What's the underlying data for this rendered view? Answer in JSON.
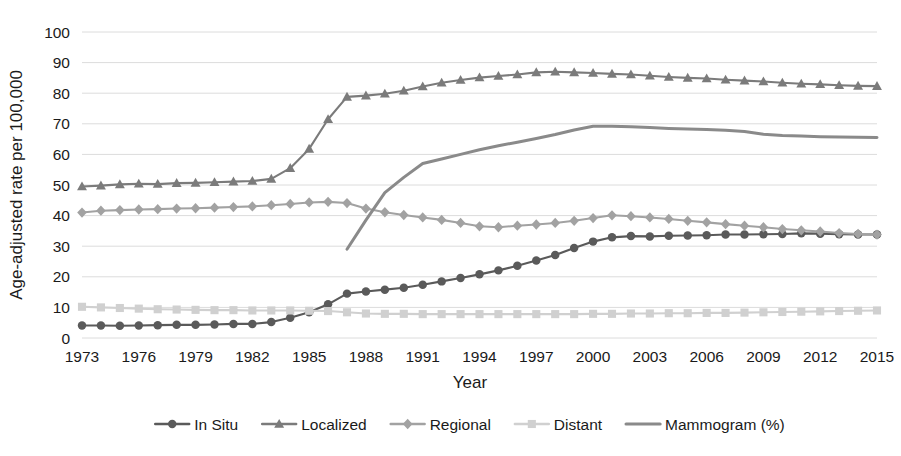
{
  "chart_data": {
    "type": "line",
    "title": "",
    "xlabel": "Year",
    "ylabel": "Age-adjusted rate per 100,000",
    "xlim": [
      1973,
      2015
    ],
    "ylim": [
      0,
      100
    ],
    "ytick_step": 10,
    "xtick_step": 3,
    "grid": true,
    "legend_position": "bottom",
    "yticks": [
      "0",
      "10",
      "20",
      "30",
      "40",
      "50",
      "60",
      "70",
      "80",
      "90",
      "100"
    ],
    "xticks": [
      "1973",
      "1976",
      "1979",
      "1982",
      "1985",
      "1988",
      "1991",
      "1994",
      "1997",
      "2000",
      "2003",
      "2006",
      "2009",
      "2012",
      "2015"
    ],
    "x": [
      1973,
      1974,
      1975,
      1976,
      1977,
      1978,
      1979,
      1980,
      1981,
      1982,
      1983,
      1984,
      1985,
      1986,
      1987,
      1988,
      1989,
      1990,
      1991,
      1992,
      1993,
      1994,
      1995,
      1996,
      1997,
      1998,
      1999,
      2000,
      2001,
      2002,
      2003,
      2004,
      2005,
      2006,
      2007,
      2008,
      2009,
      2010,
      2011,
      2012,
      2013,
      2014,
      2015
    ],
    "series": [
      {
        "name": "In Situ",
        "marker": "circle",
        "color": "#5a5a5a",
        "values": [
          4.1,
          4.1,
          4.0,
          4.1,
          4.2,
          4.3,
          4.3,
          4.4,
          4.6,
          4.6,
          5.2,
          6.6,
          8.4,
          11.0,
          14.5,
          15.2,
          15.8,
          16.4,
          17.4,
          18.5,
          19.6,
          20.8,
          22.1,
          23.6,
          25.3,
          27.1,
          29.4,
          31.5,
          32.9,
          33.3,
          33.2,
          33.4,
          33.5,
          33.6,
          33.8,
          33.8,
          33.9,
          34.0,
          34.2,
          34.1,
          33.9,
          33.8,
          33.8
        ]
      },
      {
        "name": "Localized",
        "marker": "triangle",
        "color": "#7b7b7b",
        "values": [
          49.5,
          49.8,
          50.2,
          50.4,
          50.3,
          50.6,
          50.7,
          50.9,
          51.1,
          51.3,
          52.0,
          55.5,
          61.8,
          71.5,
          78.8,
          79.2,
          79.8,
          80.8,
          82.2,
          83.4,
          84.3,
          85.1,
          85.6,
          86.1,
          86.8,
          87.0,
          86.8,
          86.6,
          86.3,
          86.1,
          85.7,
          85.3,
          85.0,
          84.8,
          84.4,
          84.1,
          83.8,
          83.4,
          83.1,
          82.9,
          82.6,
          82.4,
          82.3
        ]
      },
      {
        "name": "Regional",
        "marker": "diamond",
        "color": "#a2a2a2",
        "values": [
          41.0,
          41.6,
          41.8,
          42.0,
          42.1,
          42.3,
          42.4,
          42.6,
          42.8,
          43.0,
          43.4,
          43.8,
          44.3,
          44.5,
          44.1,
          42.3,
          41.1,
          40.2,
          39.4,
          38.6,
          37.6,
          36.5,
          36.2,
          36.7,
          37.1,
          37.6,
          38.3,
          39.2,
          40.1,
          39.8,
          39.4,
          38.9,
          38.3,
          37.8,
          37.2,
          36.7,
          36.2,
          35.6,
          35.2,
          34.8,
          34.3,
          34.0,
          33.8
        ]
      },
      {
        "name": "Distant",
        "marker": "square",
        "color": "#d0d0d0",
        "values": [
          10.2,
          10.0,
          9.8,
          9.6,
          9.4,
          9.3,
          9.2,
          9.1,
          9.1,
          9.0,
          9.0,
          9.0,
          8.9,
          8.8,
          8.4,
          8.0,
          7.9,
          7.9,
          7.8,
          7.8,
          7.8,
          7.8,
          7.8,
          7.8,
          7.8,
          7.8,
          7.8,
          7.9,
          7.9,
          8.0,
          8.0,
          8.1,
          8.1,
          8.2,
          8.2,
          8.3,
          8.4,
          8.5,
          8.6,
          8.7,
          8.8,
          8.9,
          9.0
        ]
      },
      {
        "name": "Mammogram (%)",
        "marker": "none",
        "color": "#8a8a8a",
        "values": [
          null,
          null,
          null,
          null,
          null,
          null,
          null,
          null,
          null,
          null,
          null,
          null,
          null,
          null,
          29.0,
          38.5,
          47.5,
          52.5,
          57.0,
          58.5,
          60.0,
          61.5,
          62.8,
          64.0,
          65.2,
          66.5,
          68.0,
          69.2,
          69.2,
          69.0,
          68.8,
          68.5,
          68.3,
          68.1,
          67.9,
          67.5,
          66.6,
          66.2,
          66.0,
          65.8,
          65.7,
          65.6,
          65.5
        ]
      }
    ]
  },
  "legend": {
    "items": [
      {
        "label": "In Situ"
      },
      {
        "label": "Localized"
      },
      {
        "label": "Regional"
      },
      {
        "label": "Distant"
      },
      {
        "label": "Mammogram (%)"
      }
    ]
  }
}
